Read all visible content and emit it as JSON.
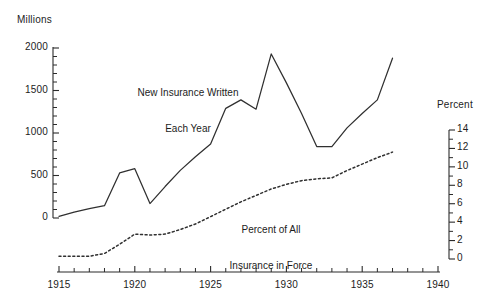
{
  "chart_data": {
    "type": "line",
    "title": "",
    "xlabel": "",
    "ylabel": "Millions",
    "ylabel_right": "Percent",
    "xlim": [
      1915,
      1940
    ],
    "ylim": [
      0,
      2000
    ],
    "ylim_right": [
      0,
      14
    ],
    "grid": false,
    "legend_position": "inline-annotations",
    "x_ticks": [
      "1915",
      "1920",
      "1925",
      "1930",
      "1935",
      "1940"
    ],
    "x_tick_values": [
      1915,
      1920,
      1925,
      1930,
      1935,
      1940
    ],
    "x_minor_step": 1,
    "y_ticks_left": [
      "0",
      "500",
      "1000",
      "1500",
      "2000"
    ],
    "y_tick_values_left": [
      0,
      500,
      1000,
      1500,
      2000
    ],
    "y_minor_step_left": 100,
    "y_ticks_right": [
      "0",
      "2",
      "4",
      "6",
      "8",
      "10",
      "12",
      "14"
    ],
    "y_tick_values_right": [
      0,
      2,
      4,
      6,
      8,
      10,
      12,
      14
    ],
    "y_minor_step_right": 1,
    "series": [
      {
        "name": "New Insurance Written Each Year",
        "style": "solid",
        "axis": "left",
        "units": "Millions",
        "x": [
          1915,
          1916,
          1917,
          1918,
          1919,
          1920,
          1921,
          1922,
          1923,
          1924,
          1925,
          1926,
          1927,
          1928,
          1929,
          1930,
          1931,
          1932,
          1933,
          1934,
          1935,
          1936,
          1937
        ],
        "values": [
          20,
          70,
          110,
          145,
          530,
          580,
          170,
          370,
          560,
          720,
          870,
          1290,
          1390,
          1280,
          1930,
          1590,
          1230,
          840,
          840,
          1060,
          1230,
          1390,
          1880
        ]
      },
      {
        "name": "Percent of All Insurance in Force",
        "style": "dotted",
        "axis": "right",
        "units": "Percent",
        "x": [
          1915,
          1916,
          1917,
          1918,
          1919,
          1920,
          1921,
          1922,
          1923,
          1924,
          1925,
          1926,
          1927,
          1928,
          1929,
          1930,
          1931,
          1932,
          1933,
          1934,
          1935,
          1936,
          1937
        ],
        "values": [
          0.3,
          0.3,
          0.3,
          0.6,
          1.6,
          2.7,
          2.6,
          2.7,
          3.2,
          3.8,
          4.6,
          5.4,
          6.2,
          6.9,
          7.6,
          8.1,
          8.5,
          8.7,
          8.8,
          9.6,
          10.3,
          11.0,
          11.6
        ]
      }
    ],
    "annotations": [
      {
        "id": "ann-new-insurance",
        "text": "New Insurance Written\nEach Year"
      },
      {
        "id": "ann-percent-in-force",
        "text": "Percent of All\nInsurance in Force"
      }
    ],
    "colors": {
      "line": "#303030",
      "axis": "#2b2b2b",
      "background": "#ffffff"
    }
  },
  "labels": {
    "left_axis_title": "Millions",
    "right_axis_title": "Percent",
    "annotation_1_line_1": "New Insurance Written",
    "annotation_1_line_2": "Each Year",
    "annotation_2_line_1": "Percent of All",
    "annotation_2_line_2": "Insurance in Force"
  }
}
